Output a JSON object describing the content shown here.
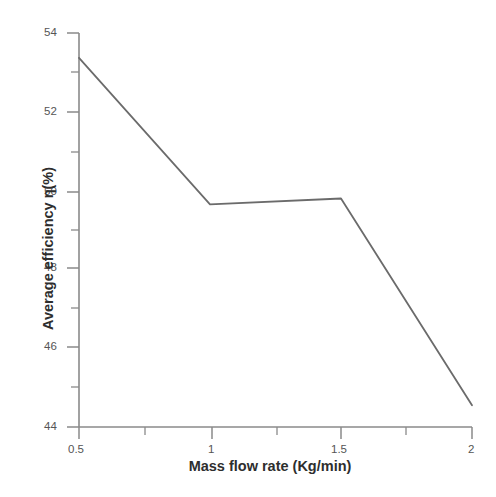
{
  "chart_data": {
    "type": "line",
    "title": "",
    "xlabel": "Mass flow rate (Kg/min)",
    "ylabel": "Average efficiency η(%)",
    "x": [
      0.5,
      1,
      1.5,
      2
    ],
    "values": [
      53.37,
      49.65,
      49.8,
      44.55
    ],
    "series": [
      {
        "name": "Average efficiency",
        "values": [
          53.37,
          49.65,
          49.8,
          44.55
        ]
      }
    ],
    "xlim": [
      0.5,
      2
    ],
    "ylim": [
      44,
      54
    ],
    "xticks": [
      0.5,
      1,
      1.5,
      2
    ],
    "xtick_labels": [
      "0.5",
      "1",
      "1.5",
      "2"
    ],
    "x_minor_ticks": [
      0.75,
      1.25,
      1.75
    ],
    "yticks": [
      44,
      46,
      48,
      50,
      52,
      54
    ],
    "ytick_labels": [
      "44",
      "46",
      "48",
      "50",
      "52",
      "54"
    ],
    "y_minor_ticks": [
      45,
      47,
      49,
      51,
      53
    ],
    "grid": false,
    "legend": "none",
    "line_color": "#6b6b6b",
    "axis_color": "#808080"
  },
  "axes": {
    "x_tick_labels": [
      {
        "text": "0.5",
        "x": 0.5
      },
      {
        "text": "1",
        "x": 1
      },
      {
        "text": "1.5",
        "x": 1.5
      },
      {
        "text": "2",
        "x": 2
      }
    ],
    "y_tick_labels": [
      {
        "text": "54",
        "y": 54
      },
      {
        "text": "52",
        "y": 52
      },
      {
        "text": "50",
        "y": 50
      },
      {
        "text": "48",
        "y": 48
      },
      {
        "text": "46",
        "y": 46
      },
      {
        "text": "44",
        "y": 44
      }
    ]
  },
  "labels": {
    "x_axis_title": "Mass flow rate (Kg/min)",
    "y_axis_title": "Average efficiency η(%)"
  }
}
